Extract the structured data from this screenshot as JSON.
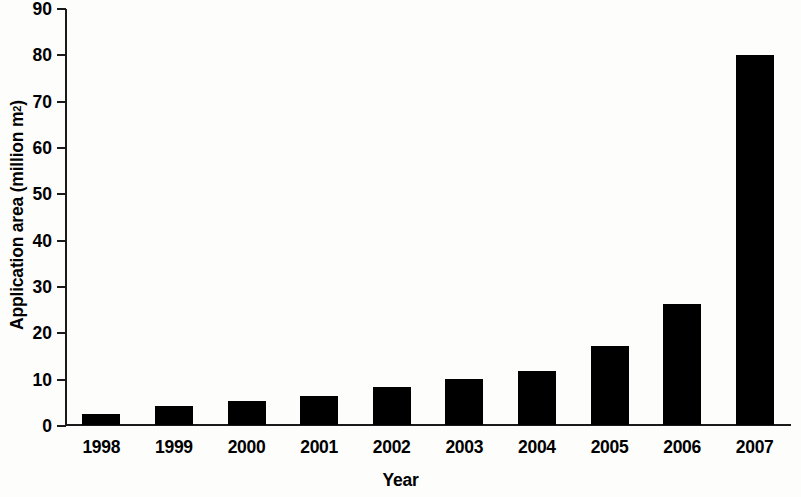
{
  "chart_data": {
    "type": "bar",
    "title": "",
    "subtitle": "",
    "xlabel": "Year",
    "ylabel": "Application area (million m2)",
    "ylabel_base": "Application area (million m",
    "ylabel_sup": "2",
    "ylabel_close": ")",
    "categories": [
      "1998",
      "1999",
      "2000",
      "2001",
      "2002",
      "2003",
      "2004",
      "2005",
      "2006",
      "2007"
    ],
    "values": [
      2.3,
      4.2,
      5.1,
      6.2,
      8.3,
      9.9,
      11.6,
      17.0,
      26.2,
      79.8
    ],
    "ylim": [
      0,
      90
    ],
    "ytick_values": [
      0,
      10,
      20,
      30,
      40,
      50,
      60,
      70,
      80,
      90
    ],
    "ytick_labels": [
      "0",
      "10",
      "20",
      "30",
      "40",
      "50",
      "60",
      "70",
      "80",
      "90"
    ],
    "grid": false,
    "legend": null,
    "bar_color": "#000000",
    "axis_color": "#1a1a1a",
    "background_color": "#fdfdfc"
  }
}
